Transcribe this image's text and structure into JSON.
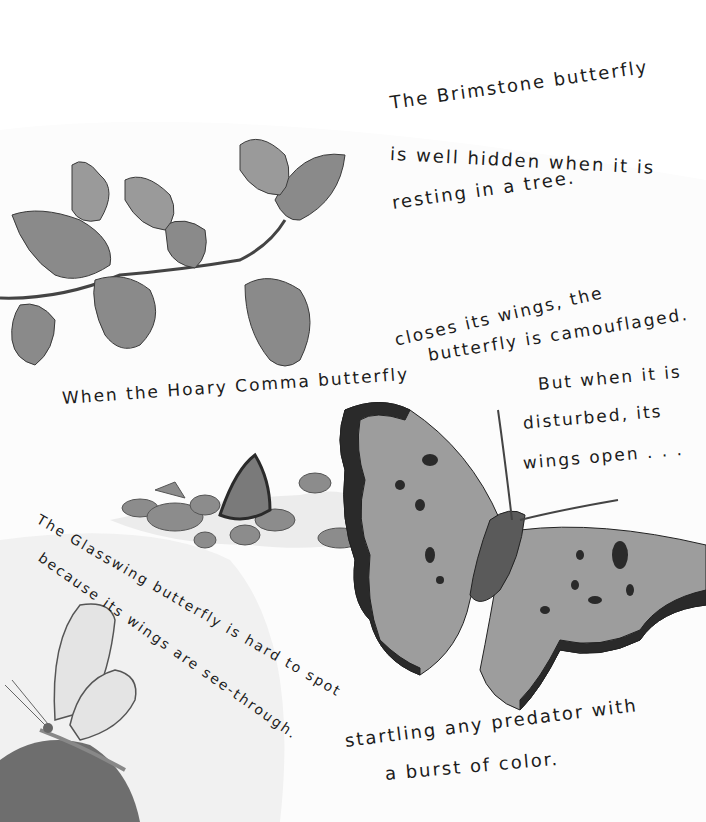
{
  "page": {
    "brimstone": {
      "line1": "The Brimstone butterfly",
      "line2": "is well hidden when it is",
      "line3": "resting in a tree."
    },
    "hoary_comma": {
      "line1": "When the Hoary Comma butterfly closes its wings, the",
      "line1a": "When the Hoary Comma butterfly",
      "line1b": "closes its wings, the",
      "line2": "butterfly is camouflaged."
    },
    "disturbed": {
      "line1": "But when it is",
      "line2": "disturbed, its",
      "line3": "wings open . . ."
    },
    "glasswing": {
      "line1": "The Glasswing butterfly is hard to spot",
      "line2": "because its wings are see-through."
    },
    "startling": {
      "line1": "startling any predator with",
      "line2": "a burst of color."
    },
    "illustrations": [
      "branch-with-brimstone-butterflies",
      "comma-butterfly-on-rocks",
      "comma-butterfly-open-wings",
      "glasswing-butterfly"
    ],
    "colors": {
      "background": "#fcfcfc",
      "ink": "#1c1c1c",
      "wash": "#7a7a7a",
      "dark_edge": "#2a2a2a"
    }
  }
}
